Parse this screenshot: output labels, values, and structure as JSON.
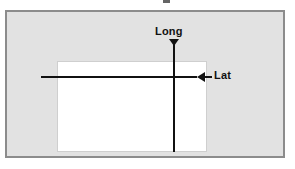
{
  "diagram": {
    "title": "",
    "type": "geographic-axes-schematic",
    "colors": {
      "frame_fill": "#e2e2e2",
      "frame_border": "#8c8c8c",
      "inner_fill": "#ffffff",
      "inner_border": "#cfcfcf",
      "line": "#111111",
      "label": "#111111",
      "page_background": "#ffffff"
    },
    "labels": {
      "longitude": "Long",
      "latitude": "Lat"
    },
    "icons": {
      "long_arrow": "arrow-down-icon",
      "lat_arrow": "arrow-left-icon"
    },
    "elements": {
      "outer_frame_name": "outer-frame",
      "inner_rect_name": "inner-rectangle",
      "vertical_line_name": "longitude-line",
      "horizontal_line_name": "latitude-line"
    }
  }
}
